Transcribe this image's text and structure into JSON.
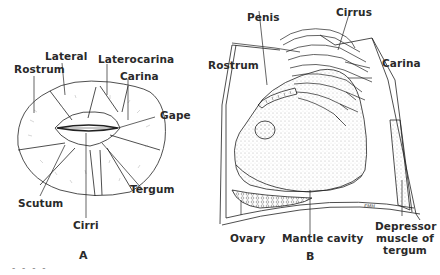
{
  "figure": {
    "caption_fragment": "- - - -",
    "panel_a": {
      "letter": "A",
      "labels": {
        "lateral": "Lateral",
        "laterocarina": "Laterocarina",
        "rostrum": "Rostrum",
        "carina": "Carina",
        "gape": "Gape",
        "scutum": "Scutum",
        "tergum": "Tergum",
        "cirri": "Cirri"
      }
    },
    "panel_b": {
      "letter": "B",
      "signature": "FMH",
      "labels": {
        "penis": "Penis",
        "cirrus": "Cirrus",
        "rostrum": "Rostrum",
        "carina": "Carina",
        "ovary": "Ovary",
        "mantle_cavity": "Mantle cavity",
        "depressor_line1": "Depressor",
        "depressor_line2": "muscle of",
        "depressor_line3": "tergum"
      }
    }
  }
}
